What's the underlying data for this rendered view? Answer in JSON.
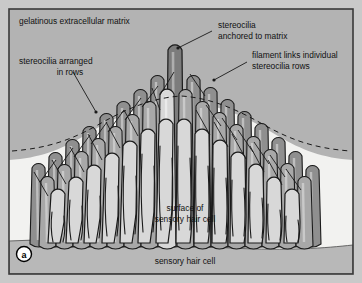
{
  "figure": {
    "panel_letter": "a",
    "width": 362,
    "height": 283
  },
  "labels": {
    "matrix": "gelatinous extracellular matrix",
    "rows_line1": "stereocilia arranged",
    "rows_line2": "in rows",
    "anchored_line1": "stereocilia",
    "anchored_line2": "anchored to matrix",
    "filament_line1": "filament links individual",
    "filament_line2": "stereocilia rows",
    "surface_line1": "surface of",
    "surface_line2": "sensory hair cell",
    "hair_cell": "sensory hair cell"
  },
  "colors": {
    "outer_margin": "#c9c9c9",
    "frame_border": "#3a3a3a",
    "matrix_fill": "#b3b3b3",
    "cell_surface_fill": "#f2f2f0",
    "hair_cell_fill": "#b8b8b8",
    "stereocilia_dark": "#8f8f8f",
    "stereocilia_mid": "#a8a8a8",
    "stereocilia_light": "#d8d8d8",
    "outline": "#1a1a1a",
    "text": "#111111",
    "leader_line": "#1a1a1a",
    "dashed_line": "#1a1a1a"
  },
  "diagram": {
    "type": "cross-section-illustration",
    "row_count": 3,
    "stereocilia_back_row": [
      {
        "x": 30,
        "top": 150,
        "w": 15,
        "shade": "dark"
      },
      {
        "x": 47,
        "top": 139,
        "w": 15,
        "shade": "dark"
      },
      {
        "x": 64,
        "top": 126,
        "w": 15,
        "shade": "dark"
      },
      {
        "x": 81,
        "top": 113,
        "w": 15,
        "shade": "dark"
      },
      {
        "x": 98,
        "top": 100,
        "w": 15,
        "shade": "dark"
      },
      {
        "x": 115,
        "top": 88,
        "w": 15,
        "shade": "dark"
      },
      {
        "x": 132,
        "top": 76,
        "w": 15,
        "shade": "dark"
      },
      {
        "x": 149,
        "top": 62,
        "w": 15,
        "shade": "dark"
      },
      {
        "x": 166,
        "top": 38,
        "w": 16,
        "shade": "darkest"
      },
      {
        "x": 185,
        "top": 62,
        "w": 15,
        "shade": "dark"
      },
      {
        "x": 202,
        "top": 74,
        "w": 15,
        "shade": "dark"
      },
      {
        "x": 219,
        "top": 86,
        "w": 15,
        "shade": "dark"
      },
      {
        "x": 236,
        "top": 98,
        "w": 15,
        "shade": "dark"
      },
      {
        "x": 253,
        "top": 110,
        "w": 15,
        "shade": "dark"
      },
      {
        "x": 270,
        "top": 124,
        "w": 15,
        "shade": "dark"
      },
      {
        "x": 287,
        "top": 138,
        "w": 15,
        "shade": "dark"
      },
      {
        "x": 304,
        "top": 152,
        "w": 15,
        "shade": "dark"
      }
    ],
    "stereocilia_mid_row": [
      {
        "x": 39,
        "top": 163,
        "w": 15,
        "shade": "mid"
      },
      {
        "x": 56,
        "top": 151,
        "w": 15,
        "shade": "mid"
      },
      {
        "x": 73,
        "top": 138,
        "w": 15,
        "shade": "mid"
      },
      {
        "x": 90,
        "top": 125,
        "w": 15,
        "shade": "mid"
      },
      {
        "x": 107,
        "top": 113,
        "w": 15,
        "shade": "mid"
      },
      {
        "x": 124,
        "top": 101,
        "w": 15,
        "shade": "mid"
      },
      {
        "x": 141,
        "top": 88,
        "w": 15,
        "shade": "mid"
      },
      {
        "x": 158,
        "top": 76,
        "w": 16,
        "shade": "light"
      },
      {
        "x": 177,
        "top": 76,
        "w": 15,
        "shade": "mid"
      },
      {
        "x": 194,
        "top": 88,
        "w": 15,
        "shade": "mid"
      },
      {
        "x": 211,
        "top": 99,
        "w": 15,
        "shade": "mid"
      },
      {
        "x": 228,
        "top": 111,
        "w": 15,
        "shade": "mid"
      },
      {
        "x": 245,
        "top": 123,
        "w": 15,
        "shade": "mid"
      },
      {
        "x": 262,
        "top": 136,
        "w": 15,
        "shade": "mid"
      },
      {
        "x": 279,
        "top": 150,
        "w": 15,
        "shade": "mid"
      },
      {
        "x": 296,
        "top": 163,
        "w": 15,
        "shade": "mid"
      }
    ],
    "stereocilia_front_row": [
      {
        "x": 48,
        "top": 176,
        "w": 16,
        "shade": "light"
      },
      {
        "x": 66,
        "top": 164,
        "w": 16,
        "shade": "light"
      },
      {
        "x": 84,
        "top": 152,
        "w": 16,
        "shade": "light"
      },
      {
        "x": 102,
        "top": 140,
        "w": 16,
        "shade": "light"
      },
      {
        "x": 120,
        "top": 128,
        "w": 16,
        "shade": "light"
      },
      {
        "x": 138,
        "top": 116,
        "w": 16,
        "shade": "light"
      },
      {
        "x": 156,
        "top": 106,
        "w": 16,
        "shade": "light"
      },
      {
        "x": 174,
        "top": 106,
        "w": 16,
        "shade": "light"
      },
      {
        "x": 192,
        "top": 116,
        "w": 16,
        "shade": "light"
      },
      {
        "x": 210,
        "top": 127,
        "w": 16,
        "shade": "light"
      },
      {
        "x": 228,
        "top": 139,
        "w": 16,
        "shade": "light"
      },
      {
        "x": 246,
        "top": 151,
        "w": 16,
        "shade": "light"
      },
      {
        "x": 264,
        "top": 164,
        "w": 16,
        "shade": "light"
      },
      {
        "x": 282,
        "top": 176,
        "w": 16,
        "shade": "light"
      }
    ]
  }
}
